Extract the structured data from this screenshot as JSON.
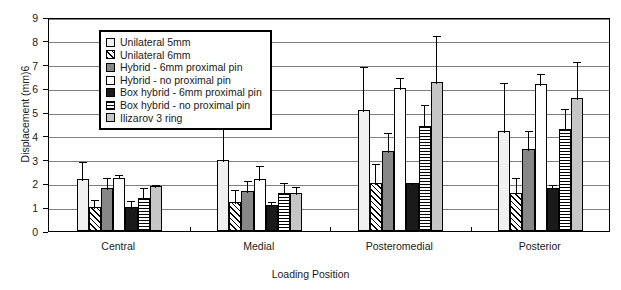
{
  "chart_data": {
    "type": "bar",
    "title": "",
    "xlabel": "Loading Position",
    "ylabel": "Displacement (mm)6",
    "ylim": [
      0,
      9
    ],
    "ytick_labels": [
      "0",
      "1",
      "2",
      "3",
      "4",
      "5",
      "6",
      "7",
      "8",
      "9"
    ],
    "grid": true,
    "legend_position": "upper-left-inside",
    "categories": [
      "Central",
      "Medial",
      "Posteromedial",
      "Posterior"
    ],
    "series": [
      {
        "name": "Unilateral 5mm",
        "fill": "f-offwhite",
        "swatch": "f-offwhite",
        "values": [
          2.2,
          3.0,
          5.1,
          4.2
        ],
        "errors_upper": [
          3.0,
          7.0,
          7.0,
          6.3
        ]
      },
      {
        "name": "Unilateral 6mm",
        "fill": "f-diag",
        "swatch": "f-diag",
        "values": [
          1.0,
          1.2,
          2.0,
          1.6
        ],
        "errors_upper": [
          1.4,
          1.8,
          2.9,
          2.3
        ]
      },
      {
        "name": "Hybrid - 6mm proximal pin",
        "fill": "f-darkgray",
        "swatch": "f-darkgray",
        "values": [
          1.8,
          1.7,
          3.35,
          3.45
        ],
        "errors_upper": [
          2.3,
          2.2,
          4.2,
          4.3
        ]
      },
      {
        "name": "Hybrid - no proximal pin",
        "fill": "f-white",
        "swatch": "f-white",
        "values": [
          2.25,
          2.2,
          6.0,
          6.2
        ],
        "errors_upper": [
          2.45,
          2.8,
          6.5,
          6.7
        ]
      },
      {
        "name": "Box hybrid - 6mm proximal pin",
        "fill": "f-black",
        "swatch": "f-black",
        "values": [
          1.0,
          1.1,
          2.0,
          1.8
        ],
        "errors_upper": [
          1.35,
          1.3,
          2.1,
          2.0
        ]
      },
      {
        "name": "Box hybrid - no proximal pin",
        "fill": "f-hstripe",
        "swatch": "f-hstripe",
        "values": [
          1.4,
          1.6,
          4.4,
          4.3
        ],
        "errors_upper": [
          1.9,
          2.1,
          5.4,
          5.2
        ]
      },
      {
        "name": "Ilizarov 3 ring",
        "fill": "f-ltgray",
        "swatch": "f-ltgray",
        "values": [
          1.9,
          1.6,
          6.25,
          5.6
        ],
        "errors_upper": [
          2.0,
          1.95,
          8.3,
          7.2
        ]
      }
    ]
  }
}
